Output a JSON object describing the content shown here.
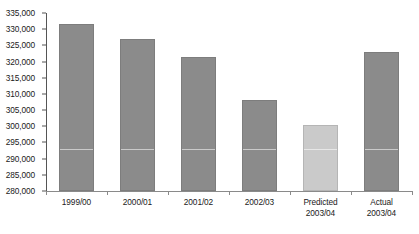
{
  "chart_data": {
    "type": "bar",
    "title": "",
    "subtitle": "",
    "xlabel": "",
    "ylabel": "",
    "ylim": [
      280000,
      335000
    ],
    "ytick_step": 5000,
    "grid": false,
    "legend": "none",
    "categories": [
      "1999/00",
      "2000/01",
      "2001/02",
      "2002/03",
      "Predicted 2003/04",
      "Actual 2003/04"
    ],
    "category_lines": [
      [
        "1999/00"
      ],
      [
        "2000/01"
      ],
      [
        "2001/02"
      ],
      [
        "2002/03"
      ],
      [
        "Predicted",
        "2003/04"
      ],
      [
        "Actual",
        "2003/04"
      ]
    ],
    "values": [
      331500,
      327000,
      321500,
      308000,
      300500,
      323000
    ],
    "bar_styles": [
      "dark",
      "dark",
      "dark",
      "dark",
      "light",
      "dark"
    ],
    "ytick_labels": [
      "335,000",
      "330,000",
      "325,000",
      "320,000",
      "315,000",
      "310,000",
      "305,000",
      "300,000",
      "295,000",
      "290,000",
      "285,000",
      "280,000"
    ],
    "ytick_values": [
      335000,
      330000,
      325000,
      320000,
      315000,
      310000,
      305000,
      300000,
      295000,
      290000,
      285000,
      280000
    ]
  },
  "colors": {
    "bar_dark": "#8b8b8b",
    "bar_light": "#cacaca",
    "axis": "#555555",
    "text": "#1a1a1a",
    "background": "#ffffff"
  }
}
